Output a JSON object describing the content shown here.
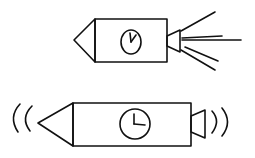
{
  "figure": {
    "stroke_color": "#111111",
    "background": "#ffffff",
    "items": [
      {
        "name": "rocket-device",
        "emits": "jet-rays",
        "clock": "clock-face"
      },
      {
        "name": "sound-device",
        "emits": "sound-waves",
        "clock": "clock-face"
      }
    ]
  }
}
